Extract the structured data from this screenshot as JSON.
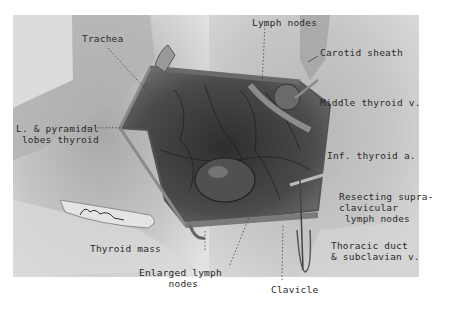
{
  "figure": {
    "signature": "L. Schnitzler",
    "colors": {
      "paper": "#ffffff",
      "plate_bg": "#cfcfcf",
      "ink": "#2a2a2a",
      "tissue_dark": "#3a3a3a"
    }
  },
  "labels": {
    "trachea": "Trachea",
    "lymph_nodes_top": "Lymph nodes",
    "carotid_sheath": "Carotid sheath",
    "middle_thyroid_v": "Middle thyroid v.",
    "pyramidal_lobes": "L. & pyramidal\n lobes thyroid",
    "inf_thyroid_a": "Inf. thyroid a.",
    "resecting_supraclavicular": "Resecting supra-\nclavicular\n lymph nodes",
    "thyroid_mass": "Thyroid mass",
    "thoracic_duct": "Thoracic duct\n& subclavian v.",
    "enlarged_lymph_nodes": "Enlarged lymph\n     nodes",
    "clavicle": "Clavicle"
  }
}
